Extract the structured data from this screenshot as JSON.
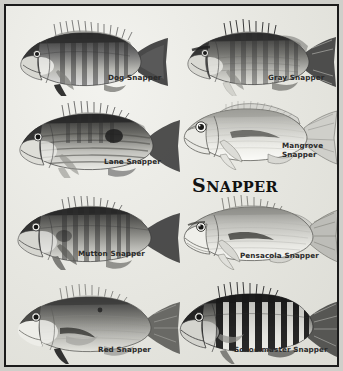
{
  "poster": {
    "title": "SNAPPER",
    "title_first_letter": "S",
    "title_rest": "NAPPER",
    "frame_color": "#1b1b1b",
    "background_color": "#e9e9e4",
    "ink_color": "#2a2a2a"
  },
  "species": [
    {
      "id": "dog-snapper",
      "label": "Dog Snapper",
      "label_line1": "Dog Snapper",
      "label_line2": "",
      "style": "dark-barred",
      "row": 1,
      "column": "left"
    },
    {
      "id": "gray-snapper",
      "label": "Gray Snapper",
      "label_line1": "Gray Snapper",
      "label_line2": "",
      "style": "dark-barred",
      "row": 1,
      "column": "right"
    },
    {
      "id": "lane-snapper",
      "label": "Lane Snapper",
      "label_line1": "Lane Snapper",
      "label_line2": "",
      "style": "striped-with-spot",
      "row": 2,
      "column": "left"
    },
    {
      "id": "mangrove-snapper",
      "label": "Mangrove Snapper",
      "label_line1": "Mangrove",
      "label_line2": "Snapper",
      "style": "pale-line-art",
      "row": 2,
      "column": "right"
    },
    {
      "id": "mutton-snapper",
      "label": "Mutton Snapper",
      "label_line1": "Mutton Snapper",
      "label_line2": "",
      "style": "dark-barred",
      "row": 3,
      "column": "left"
    },
    {
      "id": "pensacola-snapper",
      "label": "Pensacola Snapper",
      "label_line1": "Pensacola Snapper",
      "label_line2": "",
      "style": "pale-line-art",
      "row": 3,
      "column": "right"
    },
    {
      "id": "red-snapper",
      "label": "Red Snapper",
      "label_line1": "Red Snapper",
      "label_line2": "",
      "style": "plain-shaded",
      "row": 4,
      "column": "left"
    },
    {
      "id": "schoolmaster-snapper",
      "label": "Schoolmaster Snapper",
      "label_line1": "Schoolmaster Snapper",
      "label_line2": "",
      "style": "high-contrast-barred",
      "row": 4,
      "column": "right"
    }
  ]
}
